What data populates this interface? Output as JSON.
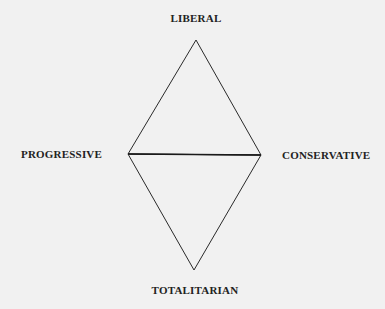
{
  "diagram": {
    "type": "political-spectrum-diamond",
    "labels": {
      "top": "LIBERAL",
      "left": "PROGRESSIVE",
      "right": "CONSERVATIVE",
      "bottom": "TOTALITARIAN"
    },
    "vertices": {
      "top": [
        196,
        40
      ],
      "left": [
        128,
        154
      ],
      "right": [
        261,
        155
      ],
      "bottom": [
        194,
        270
      ]
    },
    "colors": {
      "background": "#f1f1f1",
      "line": "#2a2a2a",
      "text": "#222222"
    }
  }
}
